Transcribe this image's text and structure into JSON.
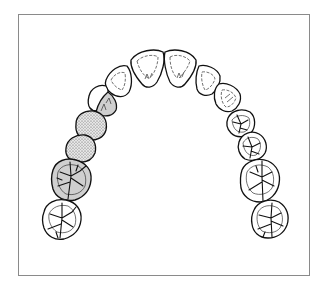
{
  "figure": {
    "caption": "",
    "colors": {
      "frame_border": "#8a8a8a",
      "background": "#ffffff",
      "outline": "#111111",
      "shaded_fill": "#cfcfcf",
      "stipple_fill": "#e6e6e6",
      "stipple_dot": "#555555"
    },
    "legend": {
      "stippled": "missing tooth / pontic",
      "shaded": "restored / abutment tooth",
      "plain": "natural tooth"
    },
    "teeth": [
      {
        "id": "11",
        "name": "upper right central incisor",
        "type": "incisor",
        "condition": "normal"
      },
      {
        "id": "21",
        "name": "upper left central incisor",
        "type": "incisor",
        "condition": "normal"
      },
      {
        "id": "12",
        "name": "upper right lateral incisor",
        "type": "incisor",
        "condition": "normal"
      },
      {
        "id": "22",
        "name": "upper left lateral incisor",
        "type": "incisor",
        "condition": "normal"
      },
      {
        "id": "13",
        "name": "upper right canine",
        "type": "canine",
        "condition": "treated"
      },
      {
        "id": "23",
        "name": "upper left canine",
        "type": "canine",
        "condition": "normal"
      },
      {
        "id": "14",
        "name": "upper right first premolar",
        "type": "premolar",
        "condition": "missing-pontic"
      },
      {
        "id": "24",
        "name": "upper left first premolar",
        "type": "premolar",
        "condition": "normal"
      },
      {
        "id": "15",
        "name": "upper right second premolar",
        "type": "premolar",
        "condition": "missing-pontic"
      },
      {
        "id": "25",
        "name": "upper left second premolar",
        "type": "premolar",
        "condition": "normal"
      },
      {
        "id": "16",
        "name": "upper right first molar",
        "type": "molar",
        "condition": "treated"
      },
      {
        "id": "26",
        "name": "upper left first molar",
        "type": "molar",
        "condition": "normal"
      },
      {
        "id": "17",
        "name": "upper right second molar",
        "type": "molar",
        "condition": "normal"
      },
      {
        "id": "27",
        "name": "upper left second molar",
        "type": "molar",
        "condition": "normal"
      }
    ]
  }
}
